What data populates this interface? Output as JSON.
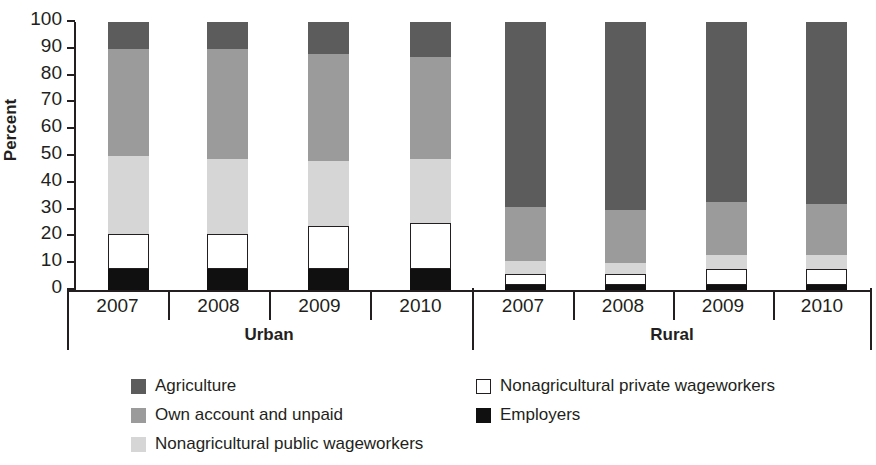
{
  "chart_data": {
    "type": "bar",
    "subtype": "stacked-bar-100",
    "title": "",
    "xlabel": "",
    "ylabel": "Percent",
    "ylim": [
      0,
      100
    ],
    "ytick_labels": [
      "0",
      "10",
      "20",
      "30",
      "40",
      "50",
      "60",
      "70",
      "80",
      "90",
      "100"
    ],
    "yticks": [
      0,
      10,
      20,
      30,
      40,
      50,
      60,
      70,
      80,
      90,
      100
    ],
    "grid": false,
    "legend_position": "bottom",
    "stack_order_bottom_to_top": [
      "Employers",
      "Nonagricultural private wageworkers",
      "Nonagricultural public wageworkers",
      "Own account and unpaid",
      "Agriculture"
    ],
    "groups": [
      {
        "name": "Urban",
        "categories": [
          "2007",
          "2008",
          "2009",
          "2010"
        ]
      },
      {
        "name": "Rural",
        "categories": [
          "2007",
          "2008",
          "2009",
          "2010"
        ]
      }
    ],
    "series": [
      {
        "name": "Employers",
        "color": "#101010",
        "values": {
          "Urban": [
            8,
            8,
            8,
            8
          ],
          "Rural": [
            2,
            2,
            2,
            2
          ]
        }
      },
      {
        "name": "Nonagricultural private wageworkers",
        "color": "#ffffff",
        "values": {
          "Urban": [
            13,
            13,
            16,
            17
          ],
          "Rural": [
            4,
            4,
            6,
            6
          ]
        }
      },
      {
        "name": "Nonagricultural public wageworkers",
        "color": "#d6d6d6",
        "values": {
          "Urban": [
            29,
            28,
            24,
            24
          ],
          "Rural": [
            5,
            4,
            5,
            5
          ]
        }
      },
      {
        "name": "Own account and unpaid",
        "color": "#9b9b9b",
        "values": {
          "Urban": [
            40,
            41,
            40,
            38
          ],
          "Rural": [
            20,
            20,
            20,
            19
          ]
        }
      },
      {
        "name": "Agriculture",
        "color": "#5c5c5c",
        "values": {
          "Urban": [
            10,
            10,
            12,
            13
          ],
          "Rural": [
            69,
            70,
            67,
            68
          ]
        }
      }
    ],
    "legend": [
      {
        "label": "Agriculture",
        "swatch": "#5c5c5c",
        "outline": false
      },
      {
        "label": "Nonagricultural private wageworkers",
        "swatch": "#ffffff",
        "outline": true
      },
      {
        "label": "Own account and unpaid",
        "swatch": "#9b9b9b",
        "outline": false
      },
      {
        "label": "Employers",
        "swatch": "#101010",
        "outline": false
      },
      {
        "label": "Nonagricultural public wageworkers",
        "swatch": "#d6d6d6",
        "outline": false
      }
    ]
  },
  "axis": {
    "y_title": "Percent"
  },
  "colors": {
    "ink": "#231f20",
    "agriculture": "#5c5c5c",
    "own_account": "#9b9b9b",
    "public_wage": "#d6d6d6",
    "private_wage": "#ffffff",
    "employers": "#101010"
  }
}
